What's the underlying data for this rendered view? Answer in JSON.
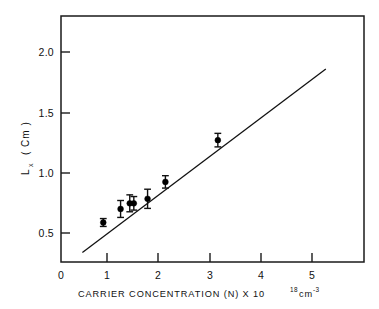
{
  "figure": {
    "background_color": "#ffffff",
    "ink_color": "#111111"
  },
  "chart_data": {
    "type": "scatter",
    "title": "",
    "subtitle": "",
    "xlabel": "CARRIER  CONCENTRATION   (N) X 10",
    "xlabel_exponent": "18",
    "xlabel_unit": "cm",
    "xlabel_unit_exponent": "-3",
    "xlabel_full": "CARRIER CONCENTRATION (N) X 10^18 cm^-3",
    "ylabel": "L",
    "ylabel_subscript": "x",
    "ylabel_unit": "( Cm )",
    "ylabel_full": "Lx (Cm)",
    "xlim": [
      0,
      5.95
    ],
    "ylim": [
      0,
      2.18
    ],
    "xticks": [
      0,
      1,
      2,
      3,
      4,
      5
    ],
    "xticklabels": [
      "0",
      "1",
      "2",
      "3",
      "4",
      "5"
    ],
    "yticks": [
      0.5,
      1.0,
      1.5,
      2.0
    ],
    "yticklabels": [
      "0.5",
      "1.0",
      "1.5",
      "2.0"
    ],
    "grid": false,
    "legend": false,
    "legend_position": "none",
    "marker": "filled-circle",
    "error_bars": "vertical",
    "x": [
      0.83,
      1.17,
      1.35,
      1.43,
      1.7,
      2.05,
      3.08
    ],
    "y": [
      0.35,
      0.47,
      0.52,
      0.52,
      0.56,
      0.71,
      1.08
    ],
    "yerr": [
      0.035,
      0.075,
      0.075,
      0.06,
      0.085,
      0.055,
      0.06
    ],
    "points": [
      {
        "x": 0.83,
        "y": 0.35,
        "yerr": 0.035
      },
      {
        "x": 1.17,
        "y": 0.47,
        "yerr": 0.075
      },
      {
        "x": 1.35,
        "y": 0.52,
        "yerr": 0.075
      },
      {
        "x": 1.43,
        "y": 0.52,
        "yerr": 0.06
      },
      {
        "x": 1.7,
        "y": 0.56,
        "yerr": 0.085
      },
      {
        "x": 2.05,
        "y": 0.71,
        "yerr": 0.055
      },
      {
        "x": 3.08,
        "y": 1.08,
        "yerr": 0.06
      }
    ],
    "fit_line": {
      "x_start": 0.42,
      "y_start": 0.085,
      "x_end": 5.2,
      "y_end": 1.71
    }
  }
}
